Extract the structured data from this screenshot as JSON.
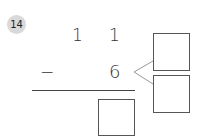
{
  "problem": {
    "number": "14",
    "minuend": {
      "tens": "1",
      "ones": "1"
    },
    "operator": "−",
    "subtrahend": "6",
    "answer_box": "",
    "split_boxes": [
      "",
      ""
    ]
  },
  "colors": {
    "badge_bg": "#d9d9d9",
    "line": "#555555",
    "split_line": "#999999"
  }
}
